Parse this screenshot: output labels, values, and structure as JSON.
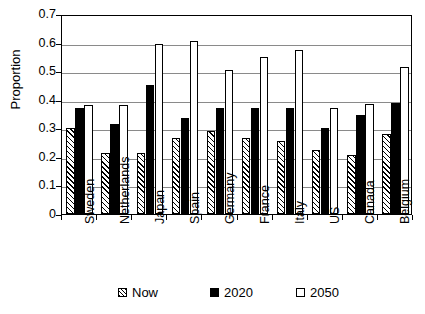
{
  "chart_data": {
    "type": "bar",
    "title": "",
    "xlabel": "",
    "ylabel": "Proportion",
    "ylim": [
      0,
      0.7
    ],
    "ytick_labels": [
      "0.7",
      "0.6",
      "0.5",
      "0.4",
      "0.3",
      "0.2",
      "0.1",
      "0"
    ],
    "ytick_values": [
      0.7,
      0.6,
      0.5,
      0.4,
      0.3,
      0.2,
      0.1,
      0
    ],
    "grid": true,
    "legend_position": "bottom",
    "categories": [
      "Sweden",
      "Netherlands",
      "Japan",
      "Spain",
      "Germany",
      "France",
      "Italy",
      "US",
      "Canada",
      "Belgium"
    ],
    "series": [
      {
        "name": "Now",
        "style": "hatched",
        "values": [
          0.3,
          0.215,
          0.215,
          0.265,
          0.29,
          0.265,
          0.255,
          0.225,
          0.205,
          0.28
        ]
      },
      {
        "name": "2020",
        "style": "black",
        "values": [
          0.37,
          0.315,
          0.45,
          0.335,
          0.37,
          0.37,
          0.37,
          0.3,
          0.345,
          0.39
        ]
      },
      {
        "name": "2050",
        "style": "white",
        "values": [
          0.38,
          0.38,
          0.595,
          0.605,
          0.505,
          0.55,
          0.575,
          0.37,
          0.385,
          0.515
        ]
      }
    ]
  },
  "legend": {
    "items": [
      {
        "label": "Now"
      },
      {
        "label": "2020"
      },
      {
        "label": "2050"
      }
    ]
  },
  "colors": {
    "axis": "#000000",
    "gridline": "#8a8a8a",
    "series_2020": "#000000",
    "series_2050": "#ffffff",
    "background": "#ffffff"
  }
}
